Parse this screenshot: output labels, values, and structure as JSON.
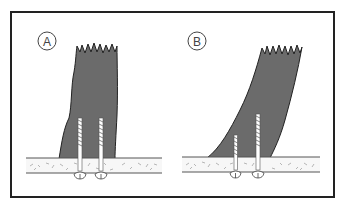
{
  "diagram": {
    "panels": [
      {
        "label": "A",
        "description": "Upright post fastened to base with two screws from below"
      },
      {
        "label": "B",
        "description": "Leaning post fastened to base with two screws of different lengths from below"
      }
    ],
    "colors": {
      "post_fill": "#6b6b6b",
      "outline": "#222222",
      "base_fill": "#f7f7f7",
      "screw_fill": "#ffffff"
    }
  }
}
